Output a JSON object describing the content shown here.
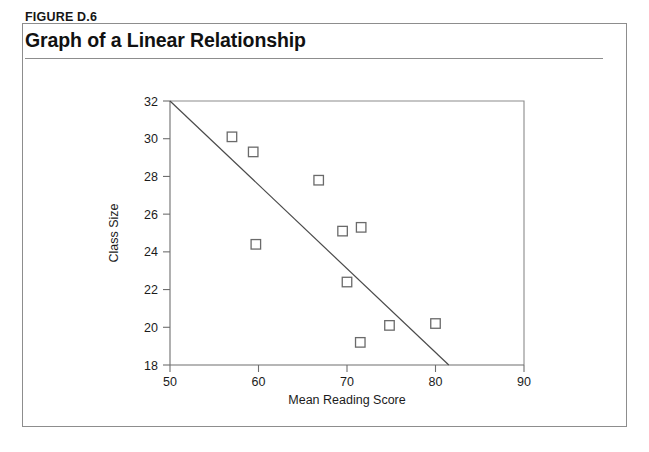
{
  "figure": {
    "number": "FIGURE D.6",
    "title": "Graph of a Linear Relationship"
  },
  "chart_data": {
    "type": "scatter",
    "title": "Graph of a Linear Relationship",
    "xlabel": "Mean Reading Score",
    "ylabel": "Class Size",
    "xlim": [
      50,
      90
    ],
    "ylim": [
      18,
      32
    ],
    "xticks": [
      50,
      60,
      70,
      80,
      90
    ],
    "yticks": [
      18,
      20,
      22,
      24,
      26,
      28,
      30,
      32
    ],
    "grid": false,
    "legend": false,
    "marker": "open-square",
    "points": [
      {
        "x": 57.0,
        "y": 30.1
      },
      {
        "x": 59.4,
        "y": 29.3
      },
      {
        "x": 59.7,
        "y": 24.4
      },
      {
        "x": 66.8,
        "y": 27.8
      },
      {
        "x": 69.5,
        "y": 25.1
      },
      {
        "x": 71.6,
        "y": 25.3
      },
      {
        "x": 70.0,
        "y": 22.4
      },
      {
        "x": 71.5,
        "y": 19.2
      },
      {
        "x": 74.8,
        "y": 20.1
      },
      {
        "x": 80.0,
        "y": 20.2
      }
    ],
    "fit_line": {
      "label": "linear trend",
      "x0": 50.0,
      "y0": 32.0,
      "x1": 81.5,
      "y1": 18.0
    }
  },
  "axis_labels": {
    "x_ticks": [
      "50",
      "60",
      "70",
      "80",
      "90"
    ],
    "y_ticks": [
      "18",
      "20",
      "22",
      "24",
      "26",
      "28",
      "30",
      "32"
    ],
    "x_title": "Mean Reading Score",
    "y_title": "Class Size"
  }
}
